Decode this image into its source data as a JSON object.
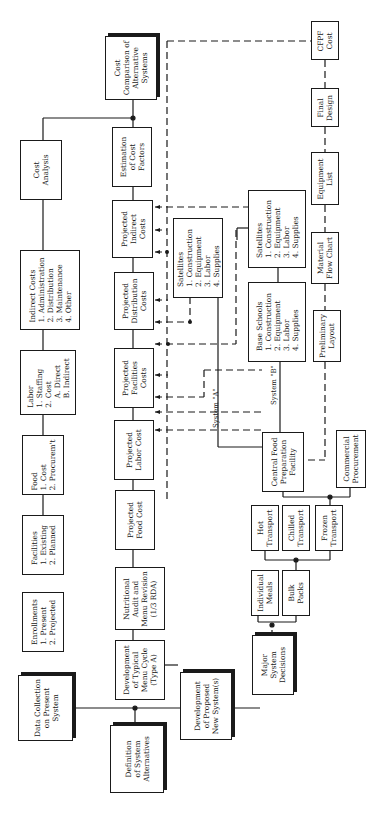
{
  "diagram": {
    "orientation": "rotated 90deg counter-clockwise",
    "boxes": {
      "cost_comparison": "Cost\nComparison of\nAlternative\nSystems",
      "cost_analysis": "Cost\nAnalysis",
      "estimation_cost_factors": "Estimation\nof Cost\nFactors",
      "indirect_costs": "Indirect Costs\n1. Administration\n2. Distribution\n3. Maintenance\n4. Other",
      "projected_indirect": "Projected\nIndirect\nCosts",
      "projected_distribution": "Projected\nDistribution\nCosts",
      "labor": "Labor\n1. Staffing\n2. Cost\n    A. Direct\n    B. Indirect",
      "projected_facilities": "Projected\nFacilities\nCosts",
      "food": "Food\n1. Cost\n2. Procurem't",
      "projected_labor": "Projected\nLabor Cost",
      "facilities": "Facilities\n1. Existing\n2. Planned",
      "projected_food": "Projected\nFood Cost",
      "enrollments": "Enrollments\n1. Present\n2. Projected",
      "nutritional_audit": "Nutritional\nAudit and\nMenu Revision\n(1/3 RDA)",
      "data_collection": "Data Collection\non Present\nSystem",
      "typical_menu": "Development\nof Typical\nMenu Cycle\n(Type A)",
      "definition_alternatives": "Definition\nof System\nAlternatives",
      "proposed_new_systems": "Development\nof Proposed\nNew System(s)",
      "major_decisions": "Major\nSystem\nDecisions",
      "satellites_a": "Satellites\n1. Construction\n2. Equipment\n3. Labor\n4. Supplies",
      "satellites_b": "Satellites\n1. Construction\n2. Equipment\n3. Labor\n4. Supplies",
      "base_schools": "Base Schools\n1. Construction\n2. Equipment\n3. Labor\n4. Supplies",
      "central_food": "Central Food\nPreparation\nFacility",
      "commercial": "Commercial\nProcurement",
      "hot_transport": "Hot\nTransport",
      "chilled_transport": "Chilled\nTransport",
      "frozen_transport": "Frozen\nTransport",
      "individual_meals": "Individual\nMeals",
      "bulk_packs": "Bulk\nPacks",
      "cfpf_cost": "CFPF\nCost",
      "final_design": "Final\nDesign",
      "equipment_list": "Equipment\nList",
      "material_flow": "Material\nFlow Chart",
      "preliminary_layout": "Preliminary\nLayout"
    },
    "labels": {
      "system_a": "System \"A\"",
      "system_b": "System \"B\""
    }
  }
}
